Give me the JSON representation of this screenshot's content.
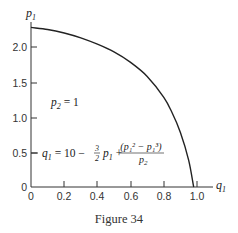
{
  "figure": {
    "caption": "Figure 34",
    "y_axis_label": "p",
    "y_axis_label_sub": "1",
    "x_axis_label": "q",
    "x_axis_label_sub": "1",
    "annotation_p2": {
      "var": "p",
      "sub": "2",
      "rest": " = 1"
    },
    "formula": {
      "lhs_var": "q",
      "lhs_sub": "1",
      "eq": " = 10 − ",
      "frac_num": "3",
      "frac_den": "2",
      "term_var": "p",
      "term_sub": "1",
      "plus": " + ",
      "num_text": "(p₁² − p₁³)",
      "den_var": "p",
      "den_sub": "2"
    }
  },
  "chart_data": {
    "type": "line",
    "title": "Figure 34",
    "xlabel": "q1",
    "ylabel": "p1",
    "xlim": [
      0,
      1.0
    ],
    "ylim": [
      0,
      2.3
    ],
    "x_ticks": [
      "0",
      "0.2",
      "0.4",
      "0.6",
      "0.8",
      "1.0"
    ],
    "y_ticks": [
      "0",
      "0.5",
      "1.0",
      "1.5",
      "2.0"
    ],
    "grid": false,
    "legend": null,
    "annotations": [
      "p2 = 1",
      "q1 = 10 − (3/2) p1 + (p1² − p1³)/p2"
    ],
    "series": [
      {
        "name": "q1(p1), p2 = 1",
        "x": [
          0.0,
          0.1,
          0.2,
          0.3,
          0.4,
          0.5,
          0.6,
          0.7,
          0.8,
          0.85,
          0.9,
          0.95,
          0.98
        ],
        "y": [
          2.28,
          2.25,
          2.2,
          2.13,
          2.04,
          1.93,
          1.78,
          1.58,
          1.28,
          1.06,
          0.78,
          0.38,
          0.0
        ]
      }
    ]
  }
}
